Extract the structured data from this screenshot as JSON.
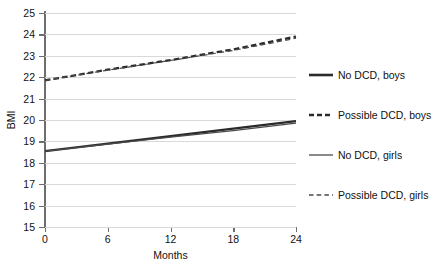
{
  "chart_data": {
    "type": "line",
    "title": "",
    "xlabel": "Months",
    "ylabel": "BMI",
    "xlim": [
      0,
      24
    ],
    "ylim": [
      15,
      25
    ],
    "x_ticks": [
      0,
      6,
      12,
      18,
      24
    ],
    "y_ticks": [
      15,
      16,
      17,
      18,
      19,
      20,
      21,
      22,
      23,
      24,
      25
    ],
    "grid": "horizontal",
    "legend_position": "right",
    "x": [
      0,
      6,
      12,
      18,
      24
    ],
    "series": [
      {
        "name": "No DCD, boys",
        "style": "solid",
        "width": "thick",
        "color": "#2b2b2b",
        "values": [
          18.55,
          18.9,
          19.25,
          19.6,
          19.95
        ]
      },
      {
        "name": "Possible DCD, boys",
        "style": "dashed",
        "width": "thick",
        "color": "#2b2b2b",
        "values": [
          21.85,
          22.35,
          22.8,
          23.3,
          23.9
        ]
      },
      {
        "name": "No DCD, girls",
        "style": "solid",
        "width": "thin",
        "color": "#4a4a4a",
        "values": [
          18.55,
          18.87,
          19.2,
          19.5,
          19.85
        ]
      },
      {
        "name": "Possible DCD, girls",
        "style": "dashed",
        "width": "thin",
        "color": "#4a4a4a",
        "values": [
          21.85,
          22.33,
          22.78,
          23.25,
          23.82
        ]
      }
    ]
  },
  "axes": {
    "y_tick_labels": [
      "25",
      "24",
      "23",
      "22",
      "21",
      "20",
      "19",
      "18",
      "17",
      "16",
      "15"
    ],
    "x_tick_labels": [
      "0",
      "6",
      "12",
      "18",
      "24"
    ],
    "x_title": "Months",
    "y_title": "BMI"
  },
  "legend": {
    "items": [
      {
        "label": "No DCD, boys"
      },
      {
        "label": "Possible DCD, boys"
      },
      {
        "label": "No DCD, girls"
      },
      {
        "label": "Possible DCD, girls"
      }
    ]
  },
  "colors": {
    "grid": "#d9d9d9",
    "axis": "#6e6e6e",
    "line_dark": "#2b2b2b",
    "line_light": "#4a4a4a",
    "text": "#111111",
    "background": "#ffffff"
  }
}
